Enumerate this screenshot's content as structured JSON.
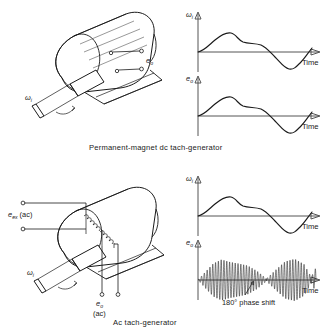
{
  "figure": {
    "background_color": "#ffffff",
    "ink_color": "#1a1a1a",
    "axis_color": "#555555"
  },
  "panels": [
    {
      "id": "dc",
      "caption": "Permanent-magnet  dc tach-generator",
      "device": {
        "name": "permanent-magnet-dc-tach-generator",
        "shaft_label": "ω",
        "shaft_label_sub": "i",
        "output_label": "e",
        "output_label_sub": "o",
        "terminal_count": 2
      },
      "plots": [
        {
          "id": "dc-omega",
          "ylabel": "ω",
          "ylabel_sub": "i",
          "xlabel": "Time",
          "waveform": "smooth-bipolar"
        },
        {
          "id": "dc-eo",
          "ylabel": "e",
          "ylabel_sub": "o",
          "xlabel": "Time",
          "waveform": "smooth-bipolar"
        }
      ]
    },
    {
      "id": "ac",
      "caption": "Ac tach-generator",
      "device": {
        "name": "ac-tach-generator",
        "shaft_label": "ω",
        "shaft_label_sub": "i",
        "excitation_label": "e",
        "excitation_label_sub": "ex",
        "excitation_label_suffix": "(ac)",
        "output_label": "e",
        "output_label_sub": "o",
        "output_label_suffix": "(ac)",
        "terminal_count": 4,
        "winding_count": 2
      },
      "plots": [
        {
          "id": "ac-omega",
          "ylabel": "ω",
          "ylabel_sub": "i",
          "xlabel": "Time",
          "waveform": "smooth-bipolar"
        },
        {
          "id": "ac-eo",
          "ylabel": "e",
          "ylabel_sub": "o",
          "xlabel": "Time",
          "waveform": "amplitude-modulated-carrier",
          "annotation": "180° phase shift"
        }
      ]
    }
  ],
  "chart_data": {
    "type": "line",
    "xlabel": "Time",
    "grid": false,
    "legend": "none",
    "xlim": [
      0,
      1
    ],
    "ylim": [
      -1,
      1
    ],
    "charts": [
      {
        "id": "dc-omega",
        "ylabel": "ωi",
        "x": [
          0.0,
          0.06,
          0.13,
          0.2,
          0.27,
          0.34,
          0.42,
          0.5,
          0.58,
          0.66,
          0.74,
          0.82,
          0.9,
          0.96,
          1.0
        ],
        "values": [
          0.0,
          0.26,
          0.55,
          0.68,
          0.6,
          0.55,
          0.48,
          0.3,
          0.04,
          -0.34,
          -0.62,
          -0.7,
          -0.52,
          -0.1,
          0.42
        ]
      },
      {
        "id": "dc-eo",
        "ylabel": "eo",
        "x": [
          0.0,
          0.06,
          0.13,
          0.2,
          0.27,
          0.34,
          0.42,
          0.5,
          0.58,
          0.66,
          0.74,
          0.82,
          0.9,
          0.96,
          1.0
        ],
        "values": [
          0.0,
          0.26,
          0.55,
          0.68,
          0.6,
          0.55,
          0.48,
          0.3,
          0.04,
          -0.34,
          -0.62,
          -0.7,
          -0.52,
          -0.1,
          0.42
        ]
      },
      {
        "id": "ac-omega",
        "ylabel": "ωi",
        "x": [
          0.0,
          0.06,
          0.13,
          0.2,
          0.27,
          0.34,
          0.42,
          0.5,
          0.58,
          0.66,
          0.74,
          0.82,
          0.9,
          0.96,
          1.0
        ],
        "values": [
          0.0,
          0.26,
          0.55,
          0.68,
          0.6,
          0.55,
          0.48,
          0.3,
          0.04,
          -0.34,
          -0.62,
          -0.7,
          -0.52,
          -0.1,
          0.42
        ]
      },
      {
        "id": "ac-eo",
        "ylabel": "eo",
        "note": "suppressed-carrier amplitude modulation; envelope equals |ωi| with 180° carrier phase reversal at the zero crossing",
        "carrier_cycles": 42,
        "envelope_x": [
          0.0,
          0.06,
          0.13,
          0.2,
          0.27,
          0.34,
          0.42,
          0.5,
          0.58,
          0.66,
          0.74,
          0.82,
          0.9,
          0.96,
          1.0
        ],
        "envelope_values": [
          0.0,
          0.26,
          0.55,
          0.68,
          0.6,
          0.55,
          0.48,
          0.3,
          0.04,
          0.34,
          0.62,
          0.7,
          0.52,
          0.1,
          0.42
        ],
        "phase_reversal_at_x": 0.58,
        "annotation": "180° phase shift"
      }
    ]
  }
}
